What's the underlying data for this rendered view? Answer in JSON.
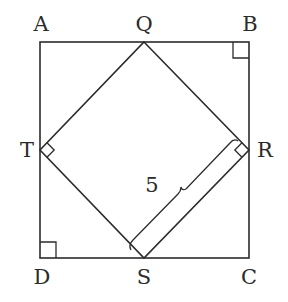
{
  "diagram": {
    "type": "geometry",
    "outer_square": {
      "vertices": [
        "A",
        "B",
        "C",
        "D"
      ],
      "coords": {
        "A": [
          40,
          42
        ],
        "B": [
          249,
          42
        ],
        "C": [
          249,
          258
        ],
        "D": [
          40,
          258
        ]
      }
    },
    "inner_square": {
      "vertices": [
        "Q",
        "R",
        "S",
        "T"
      ],
      "coords": {
        "Q": [
          144,
          42
        ],
        "R": [
          249,
          150
        ],
        "S": [
          144,
          258
        ],
        "T": [
          40,
          150
        ]
      }
    },
    "right_angle_markers": [
      "B",
      "D",
      "T",
      "R"
    ],
    "labels": {
      "A": "A",
      "B": "B",
      "C": "C",
      "D": "D",
      "Q": "Q",
      "R": "R",
      "S": "S",
      "T": "T"
    },
    "measurements": [
      {
        "segment": "RS",
        "value": "5"
      }
    ],
    "colors": {
      "stroke": "#2b2b2b",
      "background": "#ffffff"
    }
  }
}
